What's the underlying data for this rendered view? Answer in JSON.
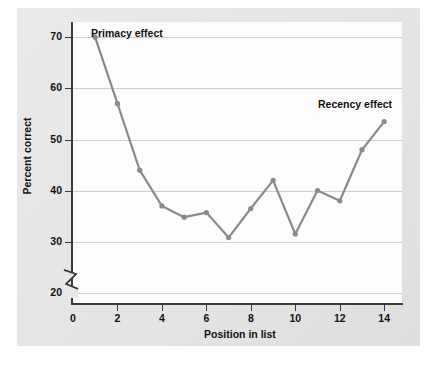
{
  "chart_data": {
    "type": "line",
    "title": "",
    "xlabel": "Position in list",
    "ylabel": "Percent correct",
    "x": [
      1,
      2,
      3,
      4,
      5,
      6,
      7,
      8,
      9,
      10,
      11,
      12,
      13,
      14
    ],
    "values": [
      70,
      57,
      44,
      37,
      34.8,
      35.7,
      30.8,
      36.5,
      42,
      31.5,
      40,
      38,
      48,
      53.5
    ],
    "series": [
      {
        "name": "Percent correct",
        "values": [
          70,
          57,
          44,
          37,
          34.8,
          35.7,
          30.8,
          36.5,
          42,
          31.5,
          40,
          38,
          48,
          53.5
        ]
      }
    ],
    "xlim": [
      0,
      14.8
    ],
    "ylim": [
      18,
      73
    ],
    "xticks": [
      0,
      2,
      4,
      6,
      8,
      10,
      12,
      14
    ],
    "yticks": [
      20,
      30,
      40,
      50,
      60,
      70
    ],
    "xtick_labels": [
      "0",
      "2",
      "4",
      "6",
      "8",
      "10",
      "12",
      "14"
    ],
    "ytick_labels": [
      "20",
      "30",
      "40",
      "50",
      "60",
      "70"
    ],
    "grid": true,
    "grid_axis": "y",
    "legend": false,
    "y_axis_break": true,
    "line_color": "#8a8a8a",
    "marker_color": "#8a8a8a",
    "marker": "circle",
    "annotations": [
      {
        "text": "Primacy effect",
        "near_point_x": 1,
        "near_point_y": 70
      },
      {
        "text": "Recency effect",
        "near_point_x": 14,
        "near_point_y": 53.5
      }
    ]
  },
  "colors": {
    "page_background": "#ffffff",
    "card_background": "#e8e8e8",
    "plot_background": "#fdfdfd",
    "axis": "#3a3a3a",
    "gridline": "#cfcfcf",
    "line": "#8a8a8a",
    "text": "#111111"
  }
}
